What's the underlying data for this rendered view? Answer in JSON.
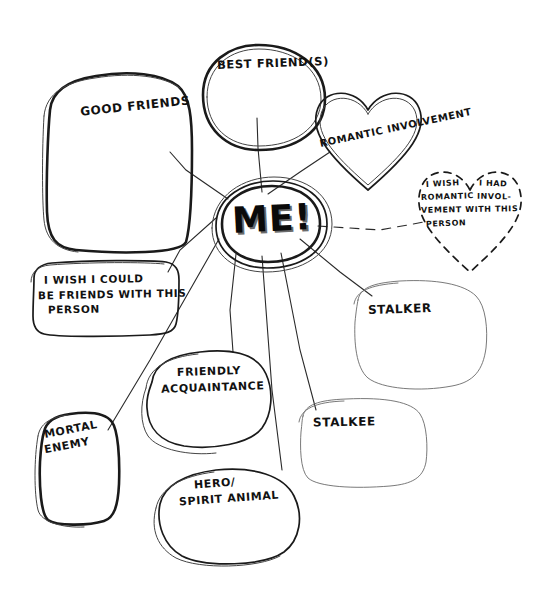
{
  "diagram": {
    "style": "hand-drawn sketch, black ink on white paper",
    "background_color": "#ffffff",
    "ink_color": "#1a1a1a",
    "center": {
      "label": "ME!",
      "shape": "oval",
      "lettering": "bold block capitals with drop shadow"
    },
    "nodes": [
      {
        "id": "good-friends",
        "label": "GOOD FRIENDS",
        "shape": "rounded-rectangle",
        "connector": "solid"
      },
      {
        "id": "best-friends",
        "label": "BEST FRIEND(S)",
        "shape": "oval",
        "connector": "solid"
      },
      {
        "id": "romantic-involvement",
        "label": "ROMANTIC INVOLVEMENT",
        "shape": "heart",
        "connector": "solid"
      },
      {
        "id": "wish-romantic",
        "label": "I WISH I HAD ROMANTIC INVOLVEMENT WITH THIS PERSON",
        "lines": [
          "I WISH",
          "I HAD",
          "ROMANTIC",
          "INVOL-",
          "VEMENT WITH THIS",
          "PERSON"
        ],
        "shape": "dashed-heart",
        "connector": "dashed"
      },
      {
        "id": "wish-friends",
        "label": "I WISH I COULD BE FRIENDS WITH THIS PERSON",
        "lines": [
          "I WISH I COULD",
          "BE FRIENDS WITH THIS",
          "PERSON"
        ],
        "shape": "rounded-rectangle",
        "connector": "solid"
      },
      {
        "id": "stalker",
        "label": "STALKER",
        "shape": "blob",
        "connector": "solid"
      },
      {
        "id": "stalkee",
        "label": "STALKEE",
        "shape": "blob",
        "connector": "solid"
      },
      {
        "id": "friendly-acquaintance",
        "label": "FRIENDLY ACQUAINTANCE",
        "lines": [
          "FRIENDLY",
          "ACQUAINTANCE"
        ],
        "shape": "blob",
        "connector": "solid"
      },
      {
        "id": "mortal-enemy",
        "label": "MORTAL ENEMY",
        "lines": [
          "MORTAL",
          "ENEMY"
        ],
        "shape": "rounded-rectangle",
        "connector": "solid"
      },
      {
        "id": "hero-spirit-animal",
        "label": "HERO/ SPIRIT ANIMAL",
        "lines": [
          "HERO/",
          "SPIRIT ANIMAL"
        ],
        "shape": "blob",
        "connector": "solid"
      }
    ],
    "labels": {
      "center": "ME!",
      "good_friends": "GOOD FRIENDS",
      "best_friends": "BEST FRIEND(S)",
      "romantic_involvement": "ROMANTIC INVOLVEMENT",
      "wish_romantic_l1": "I WISH",
      "wish_romantic_l2": "I HAD",
      "wish_romantic_l3": "ROMANTIC",
      "wish_romantic_l4": "INVOL-",
      "wish_romantic_l5": "VEMENT WITH THIS",
      "wish_romantic_l6": "PERSON",
      "wish_friends_l1": "I WISH I COULD",
      "wish_friends_l2": "BE FRIENDS WITH THIS",
      "wish_friends_l3": "PERSON",
      "stalker": "STALKER",
      "stalkee": "STALKEE",
      "friendly_acquaintance_l1": "FRIENDLY",
      "friendly_acquaintance_l2": "ACQUAINTANCE",
      "mortal_enemy_l1": "MORTAL",
      "mortal_enemy_l2": "ENEMY",
      "hero_l1": "HERO/",
      "hero_l2": "SPIRIT ANIMAL"
    }
  }
}
